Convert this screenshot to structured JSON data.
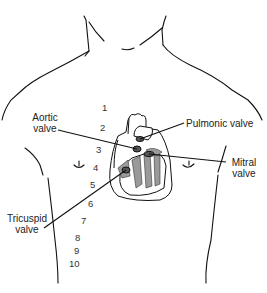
{
  "figure": {
    "labels": {
      "aortic": [
        "Aortic",
        "valve"
      ],
      "pulmonic": "Pulmonic valve",
      "mitral": [
        "Mitral",
        "valve"
      ],
      "tricuspid": [
        "Tricuspid",
        "valve"
      ]
    },
    "intercostal_numbers": [
      "1",
      "2",
      "3",
      "4",
      "5",
      "6",
      "7",
      "8",
      "9",
      "10"
    ],
    "colors": {
      "line": "#111111",
      "heart_fill": "#ffffff",
      "chamber_shade": "#9a9a9a",
      "text": "#222222"
    }
  }
}
